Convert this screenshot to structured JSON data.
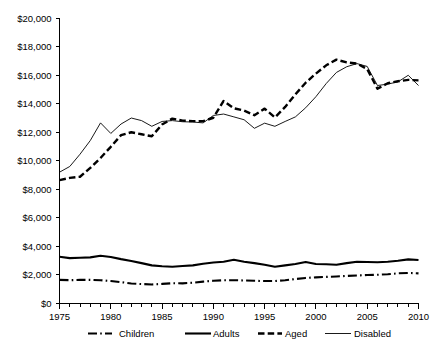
{
  "chart_data": {
    "type": "line",
    "title": "",
    "xlabel": "",
    "ylabel": "",
    "xlim": [
      1975,
      2010
    ],
    "ylim": [
      0,
      20000
    ],
    "grid": false,
    "legend_position": "bottom",
    "x_tick_labels": [
      "1975",
      "1980",
      "1985",
      "1990",
      "1995",
      "2000",
      "2005",
      "2010"
    ],
    "x_tick_values": [
      1975,
      1980,
      1985,
      1990,
      1995,
      2000,
      2005,
      2010
    ],
    "x_minor_ticks_every": 1,
    "y_tick_labels": [
      "$0",
      "$2,000",
      "$4,000",
      "$6,000",
      "$8,000",
      "$10,000",
      "$12,000",
      "$14,000",
      "$16,000",
      "$18,000",
      "$20,000"
    ],
    "y_tick_values": [
      0,
      2000,
      4000,
      6000,
      8000,
      10000,
      12000,
      14000,
      16000,
      18000,
      20000
    ],
    "x": [
      1975,
      1976,
      1977,
      1978,
      1979,
      1980,
      1981,
      1982,
      1983,
      1984,
      1985,
      1986,
      1987,
      1988,
      1989,
      1990,
      1991,
      1992,
      1993,
      1994,
      1995,
      1996,
      1997,
      1998,
      1999,
      2000,
      2001,
      2002,
      2003,
      2004,
      2005,
      2006,
      2007,
      2008,
      2009,
      2010
    ],
    "series": [
      {
        "name": "Children",
        "style": "dash-dot",
        "color": "#000000",
        "values": [
          1620,
          1600,
          1620,
          1620,
          1600,
          1540,
          1460,
          1370,
          1330,
          1300,
          1340,
          1390,
          1380,
          1420,
          1500,
          1560,
          1600,
          1600,
          1580,
          1560,
          1540,
          1540,
          1600,
          1680,
          1760,
          1800,
          1830,
          1860,
          1900,
          1930,
          1960,
          1980,
          2020,
          2080,
          2110,
          2080
        ]
      },
      {
        "name": "Adults",
        "style": "solid-thick",
        "color": "#000000",
        "values": [
          3250,
          3150,
          3180,
          3200,
          3320,
          3230,
          3080,
          2950,
          2800,
          2640,
          2580,
          2540,
          2600,
          2640,
          2760,
          2840,
          2900,
          3030,
          2900,
          2800,
          2680,
          2540,
          2640,
          2740,
          2880,
          2740,
          2720,
          2680,
          2800,
          2900,
          2880,
          2860,
          2900,
          2960,
          3060,
          3020
        ]
      },
      {
        "name": "Aged",
        "style": "dashed",
        "color": "#000000",
        "values": [
          8620,
          8780,
          8860,
          9480,
          10180,
          10960,
          11780,
          11980,
          11840,
          11700,
          12530,
          12940,
          12800,
          12760,
          12760,
          13000,
          14180,
          13660,
          13500,
          13180,
          13640,
          13020,
          13760,
          14640,
          15460,
          16100,
          16680,
          17080,
          16880,
          16800,
          16420,
          15040,
          15420,
          15560,
          15660,
          15620
        ]
      },
      {
        "name": "Disabled",
        "style": "solid-thin",
        "color": "#000000",
        "values": [
          9180,
          9580,
          10440,
          11400,
          12640,
          11900,
          12560,
          12980,
          12800,
          12400,
          12740,
          12800,
          12720,
          12700,
          12640,
          13160,
          13260,
          13060,
          12860,
          12260,
          12620,
          12400,
          12740,
          13060,
          13700,
          14480,
          15400,
          16180,
          16580,
          16800,
          16600,
          15260,
          15360,
          15520,
          15980,
          15260
        ]
      }
    ]
  },
  "legend": {
    "items": [
      {
        "label": "Children",
        "style": "dash-dot"
      },
      {
        "label": "Adults",
        "style": "solid-thick"
      },
      {
        "label": "Aged",
        "style": "dashed"
      },
      {
        "label": "Disabled",
        "style": "solid-thin"
      }
    ]
  }
}
